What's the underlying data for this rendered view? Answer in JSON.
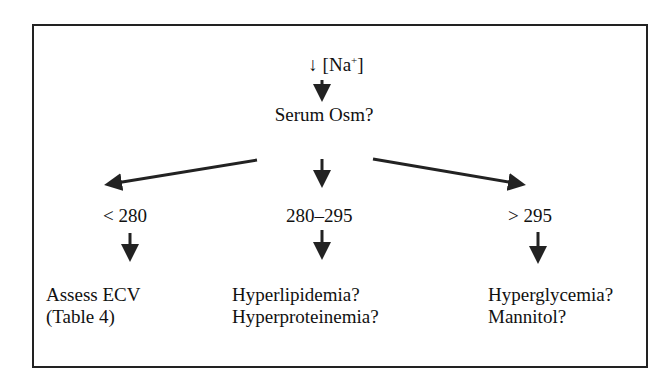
{
  "diagram": {
    "type": "flowchart",
    "title_prefix": "↓ [Na",
    "title_sup": "+",
    "title_suffix": "]",
    "question": "Serum Osm?",
    "branches": [
      {
        "range": "< 280",
        "outcome_lines": [
          "Assess ECV",
          "(Table 4)"
        ]
      },
      {
        "range": "280–295",
        "outcome_lines": [
          "Hyperlipidemia?",
          "Hyperproteinemia?"
        ]
      },
      {
        "range": "> 295",
        "outcome_lines": [
          "Hyperglycemia?",
          "Mannitol?"
        ]
      }
    ],
    "colors": {
      "stroke": "#222222",
      "text": "#111111",
      "background": "#ffffff"
    }
  }
}
